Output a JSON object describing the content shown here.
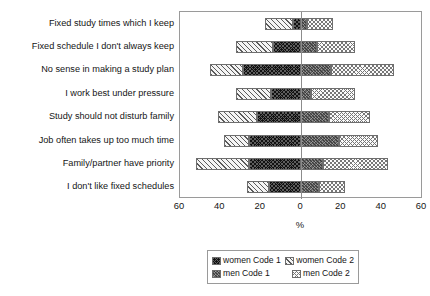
{
  "chart_data": {
    "type": "bar",
    "orientation": "horizontal",
    "style": "diverging-stacked",
    "title": "",
    "xlabel": "%",
    "ylabel": "",
    "xlim": [
      -60,
      60
    ],
    "xticks": [
      {
        "label": "60",
        "value": -60
      },
      {
        "label": "40",
        "value": -40
      },
      {
        "label": "20",
        "value": -20
      },
      {
        "label": "0",
        "value": 0
      },
      {
        "label": "20",
        "value": 20
      },
      {
        "label": "40",
        "value": 40
      },
      {
        "label": "60",
        "value": 60
      }
    ],
    "grid": false,
    "legend_position": "bottom",
    "categories": [
      "Fixed study times which I keep",
      "Fixed schedule I don't always keep",
      "No sense in making a study plan",
      "I work best under pressure",
      "Study should not disturb family",
      "Job often takes up too much time",
      "Family/partner have priority",
      "I don't like fixed schedules"
    ],
    "series": [
      {
        "name": "women Code 2",
        "side": "left",
        "values": [
          14,
          18,
          16,
          17,
          19,
          12,
          26,
          11
        ]
      },
      {
        "name": "women Code 1",
        "side": "left",
        "values": [
          4,
          14,
          29,
          15,
          22,
          26,
          26,
          16
        ]
      },
      {
        "name": "men Code 1",
        "side": "right",
        "values": [
          3,
          8,
          15,
          5,
          14,
          19,
          11,
          9
        ]
      },
      {
        "name": "men Code 2",
        "side": "right",
        "values": [
          13,
          19,
          31,
          22,
          20,
          19,
          32,
          13
        ]
      }
    ],
    "legend": [
      {
        "label": "women Code 1",
        "swatch": "black-checker"
      },
      {
        "label": "women Code 2",
        "swatch": "light-hatch"
      },
      {
        "label": "men Code 1",
        "swatch": "dark-grey-checker"
      },
      {
        "label": "men Code 2",
        "swatch": "light-dotted"
      }
    ]
  }
}
